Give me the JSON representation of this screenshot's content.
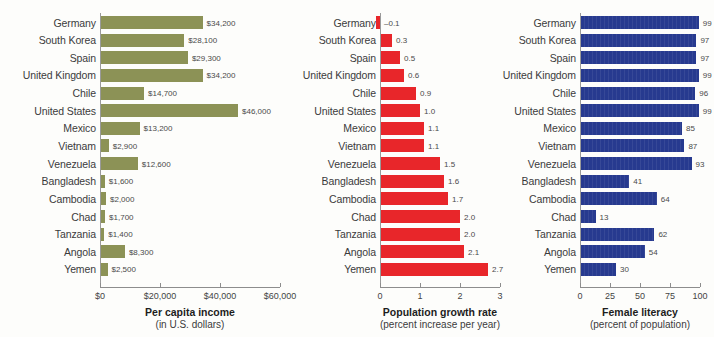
{
  "chart_data": [
    {
      "type": "bar",
      "orientation": "horizontal",
      "title": "Per capita income",
      "subtitle": "(in U.S. dollars)",
      "xlabel": "Per capita income",
      "ylabel": "",
      "color": "#8c9256",
      "xlim": [
        0,
        60000
      ],
      "ticks": [
        0,
        20000,
        40000,
        60000
      ],
      "ticklabels": [
        "$0",
        "$20,000",
        "$40,000",
        "$60,000"
      ],
      "grid": false,
      "legend": "none",
      "categories": [
        "Germany",
        "South Korea",
        "Spain",
        "United Kingdom",
        "Chile",
        "United States",
        "Mexico",
        "Vietnam",
        "Venezuela",
        "Bangladesh",
        "Cambodia",
        "Chad",
        "Tanzania",
        "Angola",
        "Yemen"
      ],
      "values": [
        34200,
        28100,
        29300,
        34200,
        14700,
        46000,
        13200,
        2900,
        12600,
        1600,
        2000,
        1700,
        1400,
        8300,
        2500
      ],
      "value_labels": [
        "$34,200",
        "$28,100",
        "$29,300",
        "$34,200",
        "$14,700",
        "$46,000",
        "$13,200",
        "$2,900",
        "$12,600",
        "$1,600",
        "$2,000",
        "$1,700",
        "$1,400",
        "$8,300",
        "$2,500"
      ]
    },
    {
      "type": "bar",
      "orientation": "horizontal",
      "title": "Population growth rate",
      "subtitle": "(percent increase per year)",
      "xlabel": "Population growth rate",
      "ylabel": "",
      "color": "#e8262a",
      "xlim": [
        -0.25,
        3
      ],
      "ticks": [
        0,
        1,
        2,
        3
      ],
      "ticklabels": [
        "0",
        "1",
        "2",
        "3"
      ],
      "grid": false,
      "legend": "none",
      "categories": [
        "Germany",
        "South Korea",
        "Spain",
        "United Kingdom",
        "Chile",
        "United States",
        "Mexico",
        "Vietnam",
        "Venezuela",
        "Bangladesh",
        "Cambodia",
        "Chad",
        "Tanzania",
        "Angola",
        "Yemen"
      ],
      "values": [
        -0.1,
        0.3,
        0.5,
        0.6,
        0.9,
        1.0,
        1.1,
        1.1,
        1.5,
        1.6,
        1.7,
        2.0,
        2.0,
        2.1,
        2.7
      ],
      "value_labels": [
        "–0.1",
        "0.3",
        "0.5",
        "0.6",
        "0.9",
        "1.0",
        "1.1",
        "1.1",
        "1.5",
        "1.6",
        "1.7",
        "2.0",
        "2.0",
        "2.1",
        "2.7"
      ]
    },
    {
      "type": "bar",
      "orientation": "horizontal",
      "title": "Female literacy",
      "subtitle": "(percent of population)",
      "xlabel": "Female literacy",
      "ylabel": "",
      "color": "#273a8f",
      "xlim": [
        0,
        100
      ],
      "ticks": [
        0,
        25,
        50,
        75,
        100
      ],
      "ticklabels": [
        "0",
        "25",
        "50",
        "75",
        "100"
      ],
      "grid": false,
      "legend": "none",
      "categories": [
        "Germany",
        "South Korea",
        "Spain",
        "United Kingdom",
        "Chile",
        "United States",
        "Mexico",
        "Vietnam",
        "Venezuela",
        "Bangladesh",
        "Cambodia",
        "Chad",
        "Tanzania",
        "Angola",
        "Yemen"
      ],
      "values": [
        99,
        97,
        97,
        99,
        96,
        99,
        85,
        87,
        93,
        41,
        64,
        13,
        62,
        54,
        30
      ],
      "value_labels": [
        "99",
        "97",
        "97",
        "99",
        "96",
        "99",
        "85",
        "87",
        "93",
        "41",
        "64",
        "13",
        "62",
        "54",
        "30"
      ]
    }
  ]
}
